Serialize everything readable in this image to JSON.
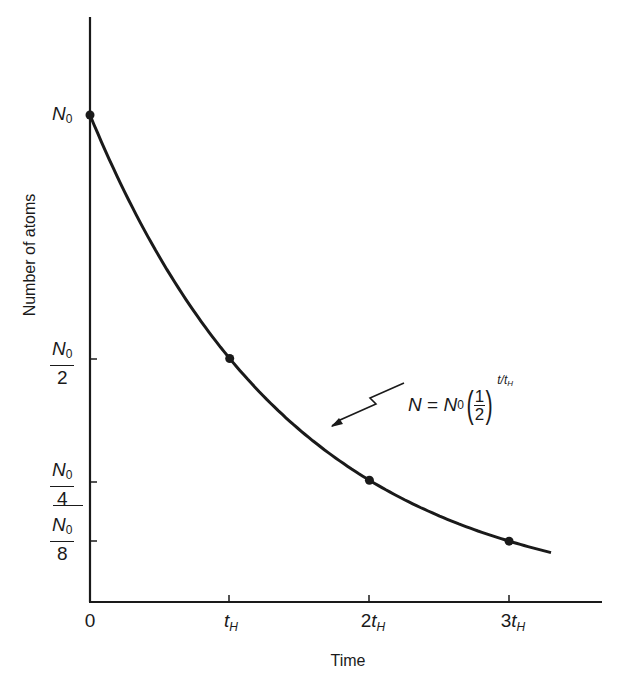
{
  "chart_data": {
    "type": "line",
    "title": "",
    "xlabel": "Time",
    "ylabel": "Number of atoms",
    "x_tick_labels": [
      "0",
      "t_H",
      "2t_H",
      "3t_H"
    ],
    "x": [
      0,
      1,
      2,
      3,
      3.3
    ],
    "x_units": "t_H (half-lives)",
    "y_tick_labels": [
      "N0",
      "N0/2",
      "N0/4",
      "N0/8"
    ],
    "y_tick_values": [
      1,
      0.5,
      0.25,
      0.125
    ],
    "series": [
      {
        "name": "N = N0 (1/2)^(t/t_H)",
        "x": [
          0,
          1,
          2,
          3
        ],
        "values": [
          1,
          0.5,
          0.25,
          0.125
        ],
        "markers": true
      }
    ],
    "curve_extends_to_x": 3.3,
    "annotations": [
      {
        "text": "N = N0(1/2)^(t/tH)",
        "points_to": "curve near x=1.7"
      }
    ],
    "grid": false,
    "legend": "none"
  },
  "labels": {
    "y_axis": "Number of atoms",
    "x_axis": "Time",
    "y_top": {
      "main": "N",
      "sub": "0"
    },
    "y_half": {
      "num_main": "N",
      "num_sub": "0",
      "den": "2"
    },
    "y_quarter": {
      "num_main": "N",
      "num_sub": "0",
      "den": "4"
    },
    "y_eighth": {
      "num_main": "N",
      "num_sub": "0",
      "den": "8"
    },
    "x_ticks": [
      {
        "coef": "0",
        "sym": "",
        "sub": ""
      },
      {
        "coef": "",
        "sym": "t",
        "sub": "H"
      },
      {
        "coef": "2",
        "sym": "t",
        "sub": "H"
      },
      {
        "coef": "3",
        "sym": "t",
        "sub": "H"
      }
    ],
    "equation": {
      "lhs": "N",
      "eq": " = ",
      "rhs_main": "N",
      "rhs_sub": "0",
      "frac_num": "1",
      "frac_den": "2",
      "exp_t": "t/t",
      "exp_sub": "H"
    }
  },
  "colors": {
    "ink": "#1a1a1a",
    "background": "#ffffff"
  }
}
